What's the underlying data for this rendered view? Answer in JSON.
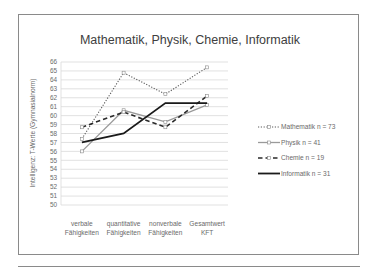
{
  "chart_data": {
    "type": "line",
    "title": "Mathematik, Physik, Chemie, Informatik",
    "xlabel": "",
    "ylabel": "Intelligenz: T-Werte (Gymnasialnorm)",
    "ylim": [
      50,
      66
    ],
    "yticks": [
      50,
      51,
      52,
      53,
      54,
      55,
      56,
      57,
      58,
      59,
      60,
      61,
      62,
      63,
      64,
      65,
      66
    ],
    "grid": true,
    "legend_position": "right",
    "categories": [
      [
        "verbale",
        "Fähigkeiten"
      ],
      [
        "quantitative",
        "Fähigkeiten"
      ],
      [
        "nonverbale",
        "Fähigkeiten"
      ],
      [
        "Gesamtwert",
        "KFT"
      ]
    ],
    "series": [
      {
        "name": "Mathematik n = 73",
        "values": [
          57.4,
          64.8,
          62.4,
          65.4
        ],
        "style": "dotted",
        "marker": "open-square",
        "color": "#5a5a5a"
      },
      {
        "name": "Physik n = 41",
        "values": [
          56.0,
          60.6,
          59.3,
          61.2
        ],
        "style": "solid-light",
        "marker": "open-square",
        "color": "#9a9a9a"
      },
      {
        "name": "Chemie n = 19",
        "values": [
          58.7,
          60.4,
          58.7,
          62.2
        ],
        "style": "dashed",
        "marker": "open-square",
        "color": "#2a2a2a"
      },
      {
        "name": "Informatik n = 31",
        "values": [
          57.0,
          58.0,
          61.4,
          61.4
        ],
        "style": "solid-bold",
        "marker": "none",
        "color": "#1a1a1a"
      }
    ]
  }
}
